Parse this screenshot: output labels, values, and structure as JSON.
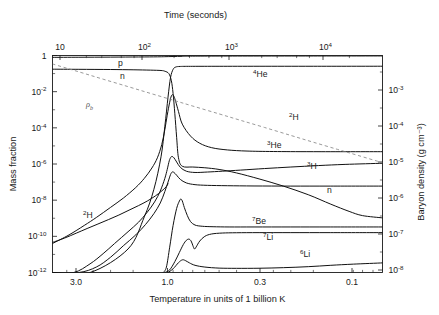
{
  "chart_data": {
    "type": "line",
    "title": "",
    "xlabel": "Temperature in units of 1 billion K",
    "ylabel": "Mass fraction",
    "top_axis_label": "Time (seconds)",
    "right_axis_label": "Baryon density (g cm⁻³)",
    "grid": false,
    "legend_position": "inline-annotations",
    "x_scale": "log-reversed",
    "y_scale": "log",
    "xlim": [
      4.2,
      0.062
    ],
    "ylim": [
      1e-12,
      1
    ],
    "x_ticks": [
      "3.0",
      "1.0",
      "0.3",
      "0.1"
    ],
    "x_tick_values": [
      3.0,
      1.0,
      0.3,
      0.1
    ],
    "top_ticks": [
      {
        "mantissa": "10",
        "exponent": ""
      },
      {
        "mantissa": "10",
        "exponent": "2"
      },
      {
        "mantissa": "10",
        "exponent": "3"
      },
      {
        "mantissa": "10",
        "exponent": "4"
      }
    ],
    "top_tick_values": [
      10,
      100,
      1000,
      10000
    ],
    "y_ticks": [
      {
        "mantissa": "1",
        "exponent": ""
      },
      {
        "mantissa": "10",
        "exponent": "-2"
      },
      {
        "mantissa": "10",
        "exponent": "-4"
      },
      {
        "mantissa": "10",
        "exponent": "-6"
      },
      {
        "mantissa": "10",
        "exponent": "-8"
      },
      {
        "mantissa": "10",
        "exponent": "-10"
      },
      {
        "mantissa": "10",
        "exponent": "-12"
      }
    ],
    "y_tick_values": [
      1,
      0.01,
      0.0001,
      1e-06,
      1e-08,
      1e-10,
      1e-12
    ],
    "right_ticks": [
      {
        "mantissa": "10",
        "exponent": "-3"
      },
      {
        "mantissa": "10",
        "exponent": "-4"
      },
      {
        "mantissa": "10",
        "exponent": "-5"
      },
      {
        "mantissa": "10",
        "exponent": "-6"
      },
      {
        "mantissa": "10",
        "exponent": "-7"
      },
      {
        "mantissa": "10",
        "exponent": "-8"
      }
    ],
    "right_tick_values": [
      0.001,
      0.0001,
      1e-05,
      1e-06,
      1e-07,
      1e-08
    ],
    "series": [
      {
        "name": "p",
        "label_text": "p",
        "label_sup": "",
        "style": "solid",
        "label_x": 118,
        "label_y": 66,
        "points": [
          [
            4.2,
            0.79
          ],
          [
            3.0,
            0.8
          ],
          [
            2.0,
            0.815
          ],
          [
            1.4,
            0.83
          ],
          [
            1.1,
            0.845
          ],
          [
            1.0,
            0.86
          ],
          [
            0.9,
            0.88
          ],
          [
            0.8,
            0.9
          ],
          [
            0.7,
            0.92
          ],
          [
            0.5,
            0.93
          ],
          [
            0.3,
            0.935
          ],
          [
            0.15,
            0.94
          ],
          [
            0.062,
            0.945
          ]
        ]
      },
      {
        "name": "n",
        "label_text": "n",
        "label_sup": "",
        "style": "solid",
        "label_x": 120,
        "label_y": 79,
        "points": [
          [
            4.2,
            0.175
          ],
          [
            3.0,
            0.172
          ],
          [
            2.0,
            0.168
          ],
          [
            1.5,
            0.162
          ],
          [
            1.2,
            0.155
          ],
          [
            1.05,
            0.148
          ],
          [
            1.0,
            0.135
          ],
          [
            0.95,
            0.1
          ],
          [
            0.92,
            0.04
          ],
          [
            0.9,
            0.008
          ],
          [
            0.88,
            0.0006
          ],
          [
            0.86,
            3e-05
          ],
          [
            0.84,
            2.2e-06
          ],
          [
            0.8,
            7.5e-07
          ],
          [
            0.7,
            6.8e-07
          ],
          [
            0.6,
            6.2e-07
          ],
          [
            0.5,
            5e-07
          ],
          [
            0.4,
            3.2e-07
          ],
          [
            0.3,
            1.5e-07
          ],
          [
            0.22,
            6e-08
          ],
          [
            0.16,
            2e-08
          ],
          [
            0.12,
            6e-09
          ],
          [
            0.095,
            2.4e-09
          ],
          [
            0.08,
            1.4e-09
          ],
          [
            0.062,
            1.05e-09
          ]
        ]
      },
      {
        "name": "4He",
        "label_text": "He",
        "label_sup": "4",
        "style": "solid",
        "label_x": 253,
        "label_y": 77,
        "points": [
          [
            4.2,
            1e-12
          ],
          [
            2.6,
            1e-12
          ],
          [
            1.6,
            2e-11
          ],
          [
            1.3,
            1.2e-09
          ],
          [
            1.15,
            4e-08
          ],
          [
            1.05,
            2.5e-06
          ],
          [
            1.0,
            0.00012
          ],
          [
            0.96,
            0.005
          ],
          [
            0.93,
            0.06
          ],
          [
            0.9,
            0.17
          ],
          [
            0.87,
            0.23
          ],
          [
            0.82,
            0.248
          ],
          [
            0.7,
            0.252
          ],
          [
            0.5,
            0.253
          ],
          [
            0.3,
            0.254
          ],
          [
            0.15,
            0.254
          ],
          [
            0.062,
            0.255
          ]
        ]
      },
      {
        "name": "2H_main",
        "label_text": "H",
        "label_sup": "2",
        "style": "solid",
        "label_x": 289,
        "label_y": 120,
        "points": [
          [
            4.2,
            4e-11
          ],
          [
            3.4,
            1.2e-10
          ],
          [
            2.8,
            4e-10
          ],
          [
            2.4,
            1.1e-09
          ],
          [
            2.0,
            4e-09
          ],
          [
            1.7,
            1.3e-08
          ],
          [
            1.45,
            5e-08
          ],
          [
            1.3,
            1.6e-07
          ],
          [
            1.18,
            6e-07
          ],
          [
            1.1,
            2.2e-06
          ],
          [
            1.04,
            1.2e-05
          ],
          [
            1.0,
            8e-05
          ],
          [
            0.97,
            0.0005
          ],
          [
            0.94,
            0.0026
          ],
          [
            0.92,
            0.0058
          ],
          [
            0.905,
            0.0068
          ],
          [
            0.89,
            0.0055
          ],
          [
            0.87,
            0.0028
          ],
          [
            0.84,
            0.0008
          ],
          [
            0.8,
            0.00016
          ],
          [
            0.72,
            3.5e-05
          ],
          [
            0.64,
            1.4e-05
          ],
          [
            0.55,
            8e-06
          ],
          [
            0.45,
            6e-06
          ],
          [
            0.35,
            5.2e-06
          ],
          [
            0.25,
            4.9e-06
          ],
          [
            0.15,
            4.8e-06
          ],
          [
            0.062,
            4.8e-06
          ]
        ]
      },
      {
        "name": "3He",
        "label_text": "He",
        "label_sup": "3",
        "style": "solid",
        "label_x": 267,
        "label_y": 148,
        "points": [
          [
            4.2,
            1e-12
          ],
          [
            3.2,
            1e-12
          ],
          [
            2.6,
            3e-12
          ],
          [
            2.2,
            1.1e-11
          ],
          [
            1.9,
            4e-11
          ],
          [
            1.6,
            1.8e-10
          ],
          [
            1.4,
            6e-10
          ],
          [
            1.25,
            2.2e-09
          ],
          [
            1.14,
            8e-09
          ],
          [
            1.06,
            3.2e-08
          ],
          [
            1.0,
            1.6e-07
          ],
          [
            0.97,
            5e-07
          ],
          [
            0.945,
            1.5e-06
          ],
          [
            0.925,
            2.4e-06
          ],
          [
            0.91,
            2.6e-06
          ],
          [
            0.89,
            2.2e-06
          ],
          [
            0.86,
            1.3e-06
          ],
          [
            0.82,
            6.5e-07
          ],
          [
            0.76,
            4e-07
          ],
          [
            0.68,
            3.4e-07
          ],
          [
            0.58,
            3.6e-07
          ],
          [
            0.48,
            4e-07
          ],
          [
            0.38,
            4.6e-07
          ],
          [
            0.28,
            5.6e-07
          ],
          [
            0.2,
            6.8e-07
          ],
          [
            0.14,
            8.2e-07
          ],
          [
            0.1,
            9.5e-07
          ],
          [
            0.062,
            1.1e-06
          ]
        ]
      },
      {
        "name": "3H",
        "label_text": "H",
        "label_sup": "3",
        "style": "solid",
        "label_x": 307,
        "label_y": 169,
        "points": [
          [
            4.2,
            1e-12
          ],
          [
            3.0,
            1e-12
          ],
          [
            2.4,
            2e-12
          ],
          [
            2.0,
            7e-12
          ],
          [
            1.7,
            3e-11
          ],
          [
            1.45,
            1.2e-10
          ],
          [
            1.28,
            4.5e-10
          ],
          [
            1.15,
            1.8e-09
          ],
          [
            1.06,
            7e-09
          ],
          [
            1.0,
            3e-08
          ],
          [
            0.96,
            1e-07
          ],
          [
            0.93,
            2.6e-07
          ],
          [
            0.91,
            3.6e-07
          ],
          [
            0.89,
            3.4e-07
          ],
          [
            0.86,
            2.4e-07
          ],
          [
            0.82,
            1.4e-07
          ],
          [
            0.76,
            9e-08
          ],
          [
            0.68,
            7.2e-08
          ],
          [
            0.58,
            6.6e-08
          ],
          [
            0.45,
            6.3e-08
          ],
          [
            0.32,
            6.1e-08
          ],
          [
            0.2,
            6e-08
          ],
          [
            0.12,
            6e-08
          ],
          [
            0.062,
            6e-08
          ]
        ]
      },
      {
        "name": "7Be",
        "label_text": "Be",
        "label_sup": "7",
        "style": "solid",
        "label_x": 252,
        "label_y": 224,
        "points": [
          [
            1.02,
            1e-12
          ],
          [
            0.98,
            2e-12
          ],
          [
            0.94,
            2.5e-11
          ],
          [
            0.9,
            4e-10
          ],
          [
            0.86,
            3.5e-09
          ],
          [
            0.83,
            9e-09
          ],
          [
            0.815,
            1.15e-08
          ],
          [
            0.8,
            9e-09
          ],
          [
            0.78,
            4e-09
          ],
          [
            0.75,
            1.4e-09
          ],
          [
            0.72,
            6.5e-10
          ],
          [
            0.68,
            4.2e-10
          ],
          [
            0.62,
            3.6e-10
          ],
          [
            0.54,
            3.4e-10
          ],
          [
            0.44,
            3.3e-10
          ],
          [
            0.32,
            3.3e-10
          ],
          [
            0.2,
            3.3e-10
          ],
          [
            0.12,
            3.3e-10
          ],
          [
            0.062,
            3.3e-10
          ]
        ]
      },
      {
        "name": "7Li",
        "label_text": "Li",
        "label_sup": "7",
        "style": "solid",
        "label_x": 263,
        "label_y": 240,
        "points": [
          [
            1.0,
            1e-12
          ],
          [
            0.94,
            1.4e-12
          ],
          [
            0.88,
            4e-12
          ],
          [
            0.83,
            1.3e-11
          ],
          [
            0.79,
            3.5e-11
          ],
          [
            0.76,
            6e-11
          ],
          [
            0.735,
            7e-11
          ],
          [
            0.715,
            5.5e-11
          ],
          [
            0.7,
            3.2e-11
          ],
          [
            0.685,
            2e-11
          ],
          [
            0.67,
            2.6e-11
          ],
          [
            0.64,
            5.5e-11
          ],
          [
            0.6,
            1e-10
          ],
          [
            0.55,
            1.35e-10
          ],
          [
            0.48,
            1.52e-10
          ],
          [
            0.4,
            1.58e-10
          ],
          [
            0.3,
            1.6e-10
          ],
          [
            0.2,
            1.6e-10
          ],
          [
            0.12,
            1.6e-10
          ],
          [
            0.062,
            1.6e-10
          ]
        ]
      },
      {
        "name": "6Li",
        "label_text": "Li",
        "label_sup": "6",
        "style": "solid",
        "label_x": 300,
        "label_y": 257,
        "points": [
          [
            0.96,
            1e-12
          ],
          [
            0.9,
            1.6e-12
          ],
          [
            0.84,
            3.5e-12
          ],
          [
            0.8,
            5e-12
          ],
          [
            0.77,
            4.6e-12
          ],
          [
            0.73,
            3.4e-12
          ],
          [
            0.68,
            2.5e-12
          ],
          [
            0.6,
            2e-12
          ],
          [
            0.5,
            1.75e-12
          ],
          [
            0.4,
            1.7e-12
          ],
          [
            0.3,
            1.72e-12
          ],
          [
            0.22,
            1.85e-12
          ],
          [
            0.16,
            2.1e-12
          ],
          [
            0.12,
            2.5e-12
          ],
          [
            0.09,
            2.9e-12
          ],
          [
            0.062,
            3.4e-12
          ]
        ]
      },
      {
        "name": "2H_rise",
        "label_text": "H",
        "label_sup": "2",
        "style": "solid",
        "label_x": 83,
        "label_y": 218,
        "points": [
          [
            4.2,
            4.6e-11
          ],
          [
            3.6,
            8e-11
          ],
          [
            3.1,
            1.5e-10
          ],
          [
            2.7,
            2.7e-10
          ],
          [
            2.35,
            4.8e-10
          ],
          [
            2.05,
            8.5e-10
          ],
          [
            1.8,
            1.5e-09
          ],
          [
            1.58,
            2.8e-09
          ],
          [
            1.4,
            5e-09
          ],
          [
            1.25,
            9e-09
          ],
          [
            1.13,
            1.7e-08
          ],
          [
            1.05,
            3e-08
          ],
          [
            1.0,
            4.6e-08
          ],
          [
            0.975,
            6.2e-08
          ],
          [
            0.96,
            8e-08
          ]
        ]
      },
      {
        "name": "rho_b",
        "label_text": "ρ",
        "label_sup": "b",
        "style": "dashed",
        "label_x": 86,
        "label_y": 107,
        "points": [
          [
            4.2,
            0.34
          ],
          [
            3.0,
            0.125
          ],
          [
            2.2,
            0.049
          ],
          [
            1.6,
            0.019
          ],
          [
            1.2,
            0.008
          ],
          [
            0.9,
            0.0034
          ],
          [
            0.7,
            0.0016
          ],
          [
            0.5,
            0.00059
          ],
          [
            0.38,
            0.00026
          ],
          [
            0.28,
            0.000105
          ],
          [
            0.2,
            3.8e-05
          ],
          [
            0.15,
            1.6e-05
          ],
          [
            0.11,
            6.4e-06
          ],
          [
            0.085,
            3e-06
          ],
          [
            0.062,
            1.18e-06
          ]
        ]
      }
    ],
    "annotations": [
      {
        "name": "n-late",
        "text": "n",
        "sup": "",
        "x": 327,
        "y": 193
      }
    ]
  }
}
